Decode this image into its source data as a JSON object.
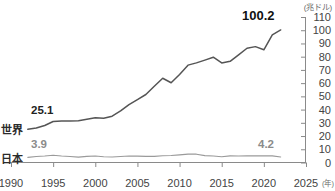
{
  "chart_data": {
    "type": "line",
    "title": "",
    "subtitle": "",
    "xlabel": "(年)",
    "ylabel": "(兆ドル)",
    "unit_label": "(兆ドル)",
    "x_unit_label": "(年)",
    "xlim": [
      1990,
      2025
    ],
    "ylim": [
      0,
      110
    ],
    "y_ticks": [
      110,
      100,
      90,
      80,
      70,
      60,
      50,
      40,
      30,
      20,
      10,
      0
    ],
    "x_ticks": [
      1990,
      1995,
      2000,
      2005,
      2010,
      2015,
      2020,
      2025
    ],
    "grid": false,
    "legend_position": "inline-left",
    "x": [
      1992,
      1993,
      1994,
      1995,
      1996,
      1997,
      1998,
      1999,
      2000,
      2001,
      2002,
      2003,
      2004,
      2005,
      2006,
      2007,
      2008,
      2009,
      2010,
      2011,
      2012,
      2013,
      2014,
      2015,
      2016,
      2017,
      2018,
      2019,
      2020,
      2021,
      2022
    ],
    "series": [
      {
        "name": "世界",
        "color": "#555555",
        "values": [
          25.1,
          26.1,
          28.0,
          31.0,
          31.4,
          31.4,
          31.6,
          32.7,
          33.8,
          33.5,
          35.0,
          39.0,
          43.8,
          47.6,
          51.4,
          57.7,
          63.7,
          60.3,
          66.6,
          73.6,
          75.3,
          77.4,
          79.6,
          75.3,
          76.5,
          81.4,
          86.4,
          87.6,
          85.2,
          96.5,
          100.2
        ],
        "label_start": "25.1",
        "label_end": "100.2"
      },
      {
        "name": "日本",
        "color": "#9a9a9a",
        "values": [
          3.9,
          4.5,
          4.9,
          5.5,
          4.9,
          4.5,
          4.1,
          4.6,
          4.9,
          4.4,
          4.2,
          4.5,
          4.9,
          4.8,
          4.6,
          4.6,
          5.1,
          5.3,
          5.8,
          6.3,
          6.3,
          5.2,
          4.9,
          4.4,
          5.0,
          4.9,
          5.0,
          5.1,
          5.0,
          5.0,
          4.2
        ],
        "label_start": "3.9",
        "label_end": "4.2"
      }
    ]
  },
  "annotations": {
    "world_series_label": "世界",
    "japan_series_label": "日本",
    "world_start_value": "25.1",
    "world_end_value": "100.2",
    "japan_start_value": "3.9",
    "japan_end_value": "4.2",
    "y_unit": "(兆ドル)",
    "x_unit": "(年)"
  },
  "y_tick_labels": [
    "110",
    "100",
    "90",
    "80",
    "70",
    "60",
    "50",
    "40",
    "30",
    "20",
    "10",
    "0"
  ],
  "x_tick_labels": [
    "1990",
    "1995",
    "2000",
    "2005",
    "2010",
    "2015",
    "2020",
    "2025"
  ],
  "colors": {
    "world_line": "#555555",
    "japan_line": "#9a9a9a",
    "axis": "#8a8a8a",
    "text": "#3a3a3a"
  }
}
